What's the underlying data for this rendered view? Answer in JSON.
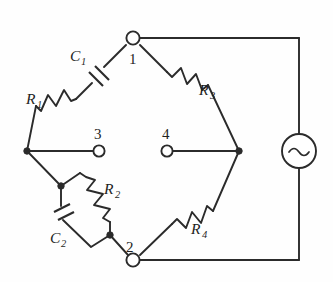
{
  "figure": {
    "background_color": "#fefefe",
    "line_color": "#2b2b2b"
  },
  "components": {
    "r1": {
      "label": "R",
      "subscript": "1",
      "type": "resistor",
      "position": "upper-left-branch"
    },
    "c1": {
      "label": "C",
      "subscript": "1",
      "type": "capacitor",
      "position": "upper-left-branch"
    },
    "r3": {
      "label": "R",
      "subscript": "3",
      "type": "resistor",
      "position": "upper-right-branch"
    },
    "r2": {
      "label": "R",
      "subscript": "2",
      "type": "resistor",
      "position": "lower-left-branch-parallel"
    },
    "c2": {
      "label": "C",
      "subscript": "2",
      "type": "capacitor",
      "position": "lower-left-branch-parallel"
    },
    "r4": {
      "label": "R",
      "subscript": "4",
      "type": "resistor",
      "position": "lower-right-branch"
    },
    "source": {
      "label": "~",
      "type": "ac-voltage-source",
      "position": "right-side"
    }
  },
  "terminals": {
    "node1": {
      "label": "1",
      "style": "open-circle"
    },
    "node2": {
      "label": "2",
      "style": "open-circle"
    },
    "node3": {
      "label": "3",
      "style": "open-circle"
    },
    "node4": {
      "label": "4",
      "style": "open-circle"
    }
  },
  "junctions": {
    "left_vertex": {
      "style": "filled-dot"
    },
    "right_vertex": {
      "style": "filled-dot"
    },
    "parallel_top": {
      "style": "filled-dot"
    },
    "parallel_bottom": {
      "style": "filled-dot"
    }
  }
}
